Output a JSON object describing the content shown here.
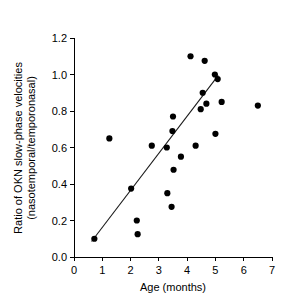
{
  "chart_data": {
    "type": "scatter",
    "title": "",
    "xlabel": "Age (months)",
    "ylabel": "Ratio of OKN slow-phase velocities (nasotemporal/temporonasal)",
    "ylabel_line1": "Ratio of OKN slow-phase velocities",
    "ylabel_line2": "(nasotemporal/temporonasal)",
    "xlim": [
      0,
      7
    ],
    "ylim": [
      0.0,
      1.2
    ],
    "xticks": [
      0,
      1,
      2,
      3,
      4,
      5,
      6,
      7
    ],
    "xtick_labels": [
      "0",
      "1",
      "2",
      "3",
      "4",
      "5",
      "6",
      "7"
    ],
    "yticks": [
      0.0,
      0.2,
      0.4,
      0.6,
      0.8,
      1.0,
      1.2
    ],
    "ytick_labels": [
      "0.0",
      "0.2",
      "0.4",
      "0.6",
      "0.8",
      "1.0",
      "1.2"
    ],
    "grid": false,
    "legend": false,
    "marker": "filled-circle",
    "marker_color": "#000000",
    "points": [
      {
        "x": 0.72,
        "y": 0.1
      },
      {
        "x": 1.25,
        "y": 0.65
      },
      {
        "x": 2.02,
        "y": 0.375
      },
      {
        "x": 2.22,
        "y": 0.2
      },
      {
        "x": 2.25,
        "y": 0.125
      },
      {
        "x": 2.75,
        "y": 0.61
      },
      {
        "x": 3.28,
        "y": 0.6
      },
      {
        "x": 3.3,
        "y": 0.35
      },
      {
        "x": 3.45,
        "y": 0.275
      },
      {
        "x": 3.48,
        "y": 0.69
      },
      {
        "x": 3.5,
        "y": 0.77
      },
      {
        "x": 3.52,
        "y": 0.478
      },
      {
        "x": 3.78,
        "y": 0.55
      },
      {
        "x": 4.12,
        "y": 1.1
      },
      {
        "x": 4.3,
        "y": 0.61
      },
      {
        "x": 4.48,
        "y": 0.81
      },
      {
        "x": 4.55,
        "y": 0.9
      },
      {
        "x": 4.62,
        "y": 1.075
      },
      {
        "x": 4.68,
        "y": 0.84
      },
      {
        "x": 4.98,
        "y": 1.0
      },
      {
        "x": 5.0,
        "y": 0.675
      },
      {
        "x": 5.08,
        "y": 0.975
      },
      {
        "x": 5.22,
        "y": 0.85
      },
      {
        "x": 6.5,
        "y": 0.83
      }
    ],
    "fit_line": {
      "type": "linear-regression",
      "x_start": 0.62,
      "y_start": 0.085,
      "x_end": 5.1,
      "y_end": 0.995
    }
  }
}
